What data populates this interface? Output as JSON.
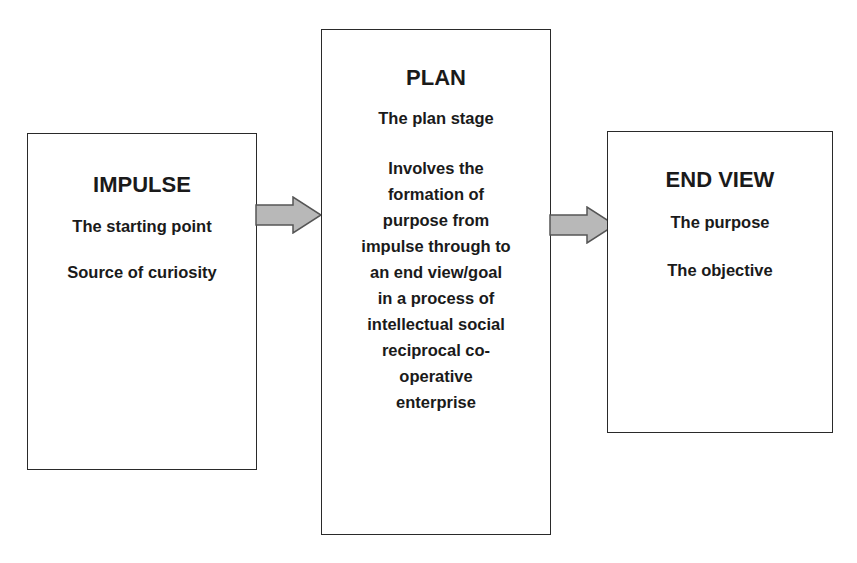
{
  "diagram": {
    "type": "flow",
    "colors": {
      "border": "#2a2a2a",
      "arrow_fill": "#b8b8b8",
      "arrow_stroke": "#555555",
      "text": "#1a1a1a"
    },
    "boxes": [
      {
        "id": "impulse",
        "title": "IMPULSE",
        "lines": [
          "The starting point",
          "Source of curiosity"
        ]
      },
      {
        "id": "plan",
        "title": "PLAN",
        "subtitle": "The plan stage",
        "body_lines": [
          "Involves the",
          "formation of",
          "purpose from",
          "impulse through to",
          "an end view/goal",
          "in a process of",
          "intellectual social",
          "reciprocal co-",
          "operative",
          "enterprise"
        ]
      },
      {
        "id": "endview",
        "title": "END VIEW",
        "lines": [
          "The purpose",
          "The objective"
        ]
      }
    ],
    "edges": [
      {
        "from": "impulse",
        "to": "plan",
        "icon": "right-block-arrow-icon"
      },
      {
        "from": "plan",
        "to": "endview",
        "icon": "right-block-arrow-icon"
      }
    ]
  }
}
